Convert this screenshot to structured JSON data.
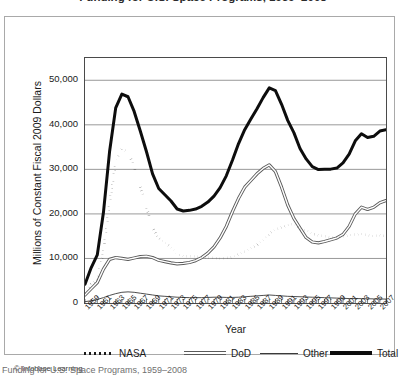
{
  "figure": {
    "title": "Funding for U.S. Space Programs, 1959–2008",
    "copyright": "© Infobase Learning",
    "caption": "Funding for U.S. Space Programs, 1959–2008"
  },
  "chart_data": {
    "type": "line",
    "title": "Funding for U.S. Space Programs, 1959–2008",
    "xlabel": "Year",
    "ylabel": "Millions of Constant Fiscal 2009 Dollars",
    "ylim": [
      0,
      55000
    ],
    "yticks": [
      0,
      10000,
      20000,
      30000,
      40000,
      50000
    ],
    "ytick_labels": [
      "0",
      "10,000",
      "20,000",
      "30,000",
      "40,000",
      "50,000"
    ],
    "xlim": [
      1959,
      2008
    ],
    "xticks": [
      1959,
      1961,
      1963,
      1965,
      1967,
      1969,
      1971,
      1973,
      1975,
      1977,
      1979,
      1981,
      1983,
      1985,
      1987,
      1989,
      1991,
      1993,
      1995,
      1997,
      1999,
      2001,
      2003,
      2005,
      2007
    ],
    "xtick_labels": [
      "1959",
      "1961",
      "1963",
      "1965",
      "1967",
      "1969",
      "1971",
      "1973",
      "1975",
      "1977",
      "1979",
      "1981",
      "1983",
      "1985",
      "1987",
      "1989",
      "1991",
      "1993",
      "1995",
      "1997",
      "1999",
      "2001",
      "2003",
      "2005",
      "2007"
    ],
    "grid": "horizontal",
    "legend_position": "below-axes",
    "x": [
      1959,
      1960,
      1961,
      1962,
      1963,
      1964,
      1965,
      1966,
      1967,
      1968,
      1969,
      1970,
      1971,
      1972,
      1973,
      1974,
      1975,
      1976,
      1977,
      1978,
      1979,
      1980,
      1981,
      1982,
      1983,
      1984,
      1985,
      1986,
      1987,
      1988,
      1989,
      1990,
      1991,
      1992,
      1993,
      1994,
      1995,
      1996,
      1997,
      1998,
      1999,
      2000,
      2001,
      2002,
      2003,
      2004,
      2005,
      2006,
      2007,
      2008
    ],
    "series": [
      {
        "name": "NASA",
        "style": "dotted",
        "color": "#1a1a1a",
        "values": [
          2100,
          4200,
          5400,
          11500,
          22500,
          31500,
          34500,
          34000,
          30500,
          26000,
          21500,
          17000,
          14500,
          13500,
          12500,
          11000,
          10500,
          10500,
          10400,
          10300,
          10200,
          10100,
          10000,
          10100,
          10300,
          11000,
          11500,
          12300,
          13000,
          14200,
          15500,
          16500,
          17000,
          17500,
          17800,
          16500,
          16300,
          15600,
          15200,
          15000,
          14700,
          14600,
          15000,
          15200,
          15400,
          15500,
          15200,
          15000,
          15200,
          15000
        ]
      },
      {
        "name": "DoD",
        "style": "double-line",
        "color": "#5a5a5a",
        "values": [
          1800,
          3200,
          4600,
          7600,
          9800,
          10200,
          10000,
          9800,
          10100,
          10400,
          10500,
          10200,
          9600,
          9300,
          9000,
          8800,
          8900,
          9100,
          9500,
          10200,
          11200,
          12600,
          14600,
          17200,
          20500,
          23500,
          26000,
          27500,
          29000,
          30200,
          31000,
          29500,
          26000,
          22000,
          19000,
          16800,
          14700,
          13700,
          13500,
          13800,
          14200,
          14600,
          15400,
          17200,
          20000,
          21500,
          21000,
          21500,
          22500,
          23000
        ]
      },
      {
        "name": "Other",
        "style": "thin",
        "color": "#3a3a3a",
        "values": [
          300,
          500,
          800,
          1200,
          1700,
          2100,
          2400,
          2500,
          2400,
          2200,
          2000,
          1800,
          1600,
          1500,
          1400,
          1300,
          1250,
          1200,
          1200,
          1200,
          1250,
          1300,
          1300,
          1250,
          1250,
          1300,
          1400,
          1500,
          1600,
          1700,
          1800,
          1700,
          1600,
          1500,
          1450,
          1400,
          1350,
          1300,
          1250,
          1200,
          1150,
          1100,
          1050,
          1000,
          1000,
          980,
          950,
          930,
          900,
          880
        ]
      },
      {
        "name": "Total",
        "style": "thick",
        "color": "#0d0d0d",
        "values": [
          4200,
          7900,
          10800,
          20300,
          34000,
          43800,
          46900,
          46300,
          43000,
          38600,
          34000,
          29000,
          25700,
          24300,
          22900,
          21100,
          20650,
          20800,
          21100,
          21700,
          22650,
          24000,
          25900,
          28550,
          32050,
          35800,
          38900,
          41300,
          43600,
          46100,
          48300,
          47700,
          44600,
          41000,
          38250,
          34700,
          32350,
          30600,
          29950,
          30000,
          30050,
          30300,
          31450,
          33400,
          36400,
          37980,
          37150,
          37430,
          38600,
          38880
        ]
      }
    ]
  },
  "axes": {
    "y_title": "Millions of Constant Fiscal 2009 Dollars",
    "x_title": "Year"
  },
  "legend": [
    {
      "label": "NASA",
      "style": "dotted"
    },
    {
      "label": "DoD",
      "style": "double-line"
    },
    {
      "label": "Other",
      "style": "thin"
    },
    {
      "label": "Total",
      "style": "thick"
    }
  ]
}
